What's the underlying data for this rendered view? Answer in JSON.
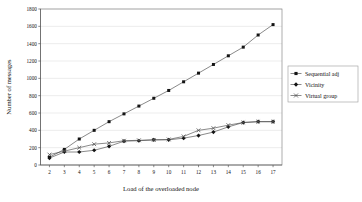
{
  "chart_data": {
    "type": "line",
    "title": "",
    "xlabel": "Load of the overloaded node",
    "ylabel": "Number of messages",
    "xlim": [
      1.4,
      17.6
    ],
    "ylim": [
      0,
      1800
    ],
    "grid": true,
    "grid_axis": "y",
    "legend_position": "right",
    "x": [
      2,
      3,
      4,
      5,
      6,
      7,
      8,
      9,
      10,
      11,
      12,
      13,
      14,
      15,
      16,
      17
    ],
    "xticklabels": [
      "2",
      "3",
      "4",
      "5",
      "6",
      "7",
      "8",
      "9",
      "10",
      "11",
      "12",
      "13",
      "14",
      "15",
      "16",
      "17"
    ],
    "yticks": [
      0,
      200,
      400,
      600,
      800,
      1000,
      1200,
      1400,
      1600,
      1800
    ],
    "yticklabels": [
      "0",
      "200",
      "400",
      "600",
      "800",
      "1000",
      "1200",
      "1400",
      "1600",
      "1800"
    ],
    "series": [
      {
        "name": "Sequential adj",
        "marker": "square",
        "values": [
          90,
          180,
          300,
          400,
          500,
          590,
          680,
          770,
          860,
          960,
          1060,
          1160,
          1260,
          1360,
          1500,
          1620
        ]
      },
      {
        "name": "Vicinity",
        "marker": "diamond",
        "values": [
          80,
          150,
          150,
          170,
          215,
          275,
          280,
          290,
          290,
          310,
          340,
          380,
          440,
          490,
          500,
          500
        ]
      },
      {
        "name": "Virtual group",
        "marker": "x",
        "values": [
          120,
          160,
          200,
          240,
          255,
          280,
          285,
          290,
          295,
          330,
          400,
          425,
          460,
          490,
          500,
          500
        ]
      }
    ]
  },
  "legend": {
    "items": [
      {
        "label": "Sequential adj",
        "marker": "square"
      },
      {
        "label": "Vicinity",
        "marker": "diamond"
      },
      {
        "label": "Virtual group",
        "marker": "x"
      }
    ]
  },
  "axes": {
    "x_title": "Load of the overloaded node",
    "y_title": "Number of messages"
  }
}
